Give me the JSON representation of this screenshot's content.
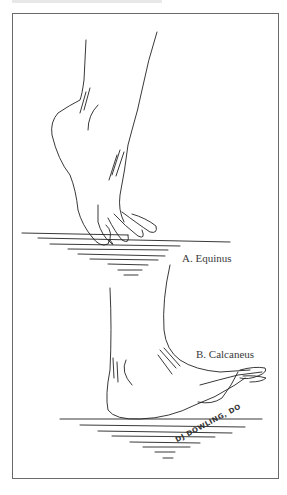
{
  "figure": {
    "panels": [
      {
        "id": "A",
        "label": "A. Equinus"
      },
      {
        "id": "B",
        "label": "B. Calcaneus"
      }
    ],
    "signature": "DJ DOWLING, DO"
  },
  "colors": {
    "line": "#222222",
    "frame": "#6a6a6a",
    "label": "#3a3a3a"
  }
}
